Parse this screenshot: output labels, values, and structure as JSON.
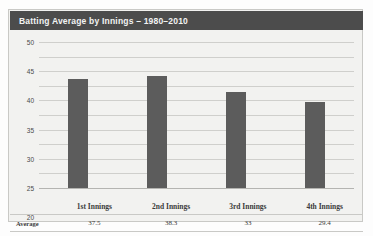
{
  "chart_data": {
    "type": "bar",
    "title": "Batting Average by Innings – 1980–2010",
    "categories": [
      "1st Innings",
      "2nd Innings",
      "3rd Innings",
      "4th Innings"
    ],
    "values": [
      37.5,
      38.3,
      33,
      29.4
    ],
    "value_labels": [
      "37.5",
      "38.3",
      "33",
      "29.4"
    ],
    "series_name": "Average",
    "xlabel": "",
    "ylabel": "",
    "ylim": [
      0,
      50
    ],
    "yticks": [
      50,
      45,
      40,
      35,
      30,
      25,
      20,
      15,
      10,
      5,
      0
    ],
    "ytick_labels": [
      "50",
      "45",
      "40",
      "35",
      "30",
      "25",
      "20",
      "15",
      "10",
      "5",
      "0"
    ],
    "grid": true,
    "legend": false,
    "bar_color": "#5c5c5c",
    "title_bar_color": "#4c4c4c",
    "panel_color": "#f2f2f0",
    "gridline_color": "#cfcfcc"
  },
  "table": {
    "row_label": "Average",
    "headers": [
      "1st Innings",
      "2nd Innings",
      "3rd Innings",
      "4th Innings"
    ],
    "values": [
      "37.5",
      "38.3",
      "33",
      "29.4"
    ]
  }
}
